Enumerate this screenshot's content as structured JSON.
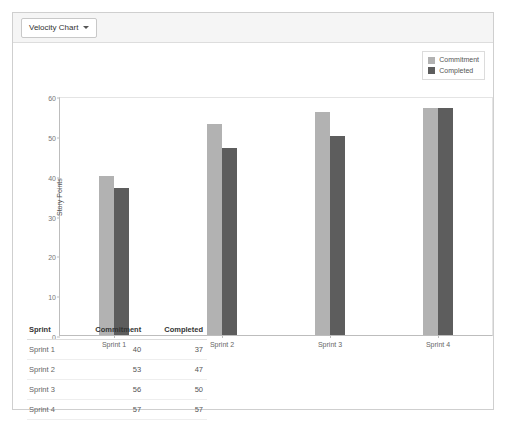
{
  "card": {
    "dropdown_label": "Velocity Chart",
    "caret_icon": "chevron-down-icon"
  },
  "chart_data": {
    "type": "bar",
    "title": "",
    "xlabel": "",
    "ylabel": "Story Points",
    "categories": [
      "Sprint 1",
      "Sprint 2",
      "Sprint 3",
      "Sprint 4"
    ],
    "series": [
      {
        "name": "Commitment",
        "values": [
          40,
          53,
          56,
          57
        ],
        "color": "#b2b2b2"
      },
      {
        "name": "Completed",
        "values": [
          37,
          47,
          50,
          57
        ],
        "color": "#5d5d5d"
      }
    ],
    "ylim": [
      0,
      60
    ],
    "yticks": [
      0,
      10,
      20,
      30,
      40,
      50,
      60
    ],
    "grid": false,
    "legend_position": "top-right"
  },
  "table": {
    "columns": [
      "Sprint",
      "Commitment",
      "Completed"
    ],
    "rows": [
      [
        "Sprint 1",
        "40",
        "37"
      ],
      [
        "Sprint 2",
        "53",
        "47"
      ],
      [
        "Sprint 3",
        "56",
        "50"
      ],
      [
        "Sprint 4",
        "57",
        "57"
      ]
    ]
  }
}
